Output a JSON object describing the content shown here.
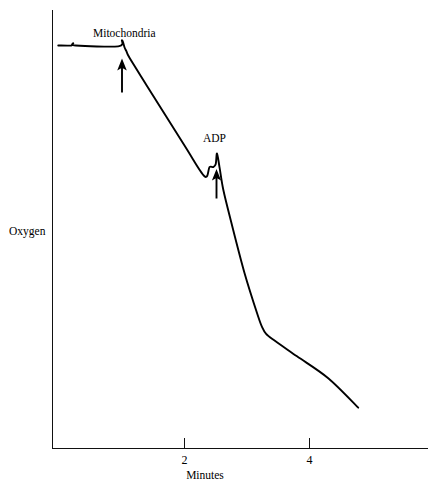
{
  "figure": {
    "title": "",
    "background_color": "#ffffff",
    "ink_color": "#000000"
  },
  "axes": {
    "x_title": "Minutes",
    "y_title": "Oxygen",
    "x_ticks": [
      {
        "label": "2",
        "value": 2
      },
      {
        "label": "4",
        "value": 4
      }
    ],
    "y_ticks": []
  },
  "annotations": [
    {
      "label": "Mitochondria",
      "arrow": "up-arrow",
      "at_minutes": 1.04
    },
    {
      "label": "ADP",
      "arrow": "up-arrow",
      "at_minutes": 2.52
    }
  ],
  "chart_data": {
    "type": "line",
    "title": "",
    "subtitle": "",
    "xlabel": "Minutes",
    "ylabel": "Oxygen",
    "xlim": [
      0,
      5.9
    ],
    "ylim": [
      0,
      1
    ],
    "grid": false,
    "legend": null,
    "x_tick_labels": [
      "2",
      "4"
    ],
    "x_tick_values": [
      2,
      4
    ],
    "y_tick_labels": [],
    "annotations": [
      {
        "text": "Mitochondria",
        "x": 1.04,
        "y": 0.908,
        "marker": "up-arrow",
        "meaning": "mitochondria added to the chamber"
      },
      {
        "text": "ADP",
        "x": 2.52,
        "y": 0.65,
        "marker": "up-arrow",
        "meaning": "ADP added to the chamber"
      }
    ],
    "series": [
      {
        "name": "Dissolved oxygen",
        "x": [
          -0.02,
          0.19,
          0.22,
          0.26,
          0.94,
          1.0,
          1.04,
          1.07,
          1.12,
          1.4,
          2.0,
          2.32,
          2.4,
          2.46,
          2.5,
          2.52,
          2.56,
          2.62,
          2.74,
          2.96,
          3.18,
          3.25,
          3.3,
          3.4,
          3.8,
          4.3,
          4.78
        ],
        "y": [
          0.918,
          0.918,
          0.923,
          0.918,
          0.916,
          0.93,
          0.914,
          0.905,
          0.89,
          0.826,
          0.69,
          0.62,
          0.641,
          0.641,
          0.648,
          0.672,
          0.641,
          0.59,
          0.52,
          0.4,
          0.3,
          0.274,
          0.262,
          0.25,
          0.21,
          0.16,
          0.093
        ]
      }
    ]
  }
}
